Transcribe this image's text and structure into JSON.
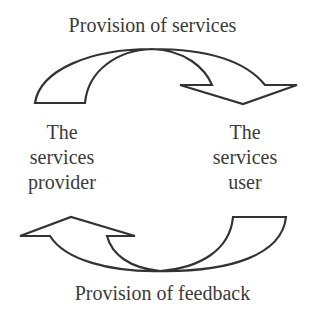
{
  "diagram": {
    "top_label": "Provision of services",
    "bottom_label": "Provision of feedback",
    "left_node": {
      "lines": [
        "The",
        "services",
        "provider"
      ]
    },
    "right_node": {
      "lines": [
        "The",
        "services",
        "user"
      ]
    },
    "arrows": [
      {
        "name": "services-arrow",
        "from": "The services provider",
        "to": "The services user",
        "direction": "clockwise-top"
      },
      {
        "name": "feedback-arrow",
        "from": "The services user",
        "to": "The services provider",
        "direction": "clockwise-bottom"
      }
    ],
    "stroke_color": "#333333",
    "fill_color": "#ffffff"
  }
}
